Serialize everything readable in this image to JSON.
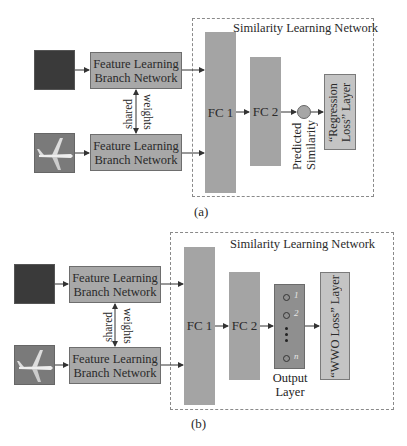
{
  "panels": [
    {
      "id": "a",
      "label": "(a)",
      "container_title": "Similarity Learning Network",
      "branch_top": {
        "line1": "Feature Learning",
        "line2": "Branch Network"
      },
      "branch_bottom": {
        "line1": "Feature Learning",
        "line2": "Branch Network"
      },
      "shared_label": "shared",
      "weights_label": "weights",
      "fc1": "FC 1",
      "fc2": "FC 2",
      "predicted_label_line1": "Predicted",
      "predicted_label_line2": "Similarity",
      "loss_line1": "“Regression",
      "loss_line2": "Loss” Layer",
      "input_images": [
        "dark-texture-image",
        "airplane-image"
      ]
    },
    {
      "id": "b",
      "label": "(b)",
      "container_title": "Similarity Learning Network",
      "branch_top": {
        "line1": "Feature Learning",
        "line2": "Branch Network"
      },
      "branch_bottom": {
        "line1": "Feature Learning",
        "line2": "Branch Network"
      },
      "shared_label": "shared",
      "weights_label": "weights",
      "fc1": "FC 1",
      "fc2": "FC 2",
      "output_nodes": [
        "1",
        "2",
        "n"
      ],
      "output_label_line1": "Output",
      "output_label_line2": "Layer",
      "loss_line1": "“WWO Loss” Layer",
      "input_images": [
        "dark-texture-image",
        "airplane-image"
      ]
    }
  ],
  "colors": {
    "block_gray": "#a4a4a4",
    "loss_box": "#c4c4c4",
    "output_layer": "#8f8f8f",
    "dark_image": "#3a3a3a",
    "dashed_border": "#8a8a8a"
  }
}
